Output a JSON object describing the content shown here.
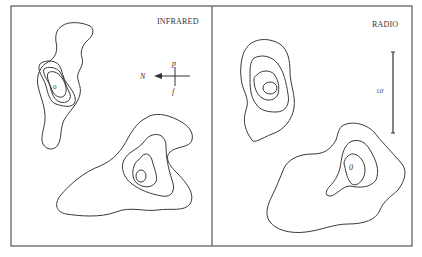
{
  "figure": {
    "panels": [
      {
        "id": "infrared",
        "label": "INFRARED",
        "sources": [
          {
            "name": "upper-left source",
            "peak_marker": "0",
            "contour_levels": 4
          },
          {
            "name": "lower-right source",
            "peak_marker": "0",
            "contour_levels": 4
          }
        ],
        "compass": {
          "north_label": "N",
          "p_label": "p",
          "f_label": "f",
          "arrow_direction": "left"
        }
      },
      {
        "id": "radio",
        "label": "RADIO",
        "sources": [
          {
            "name": "upper-left source",
            "peak_marker": "",
            "contour_levels": 4
          },
          {
            "name": "lower-right source",
            "peak_marker": "0",
            "contour_levels": 3
          }
        ],
        "scale_bar": {
          "label": "10'"
        }
      }
    ],
    "colors": {
      "line": "#3a3a3a",
      "frame": "#555555",
      "background": "#ffffff"
    }
  }
}
